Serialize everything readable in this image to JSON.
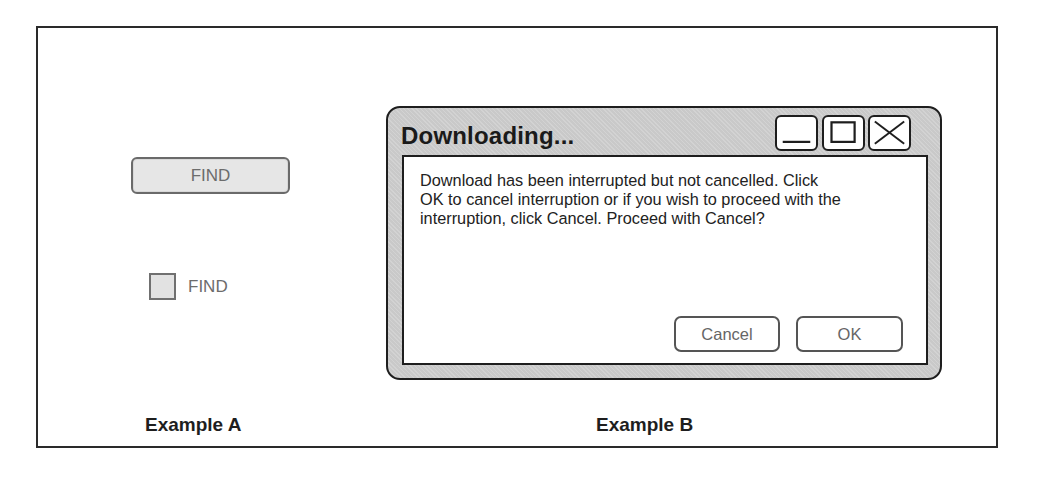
{
  "example_a": {
    "find_button_label": "FIND",
    "find_checkbox_label": "FIND",
    "caption": "Example A"
  },
  "example_b": {
    "dialog": {
      "title": "Downloading...",
      "message": "Download has been interrupted but not cancelled. Click OK to cancel interruption or if you wish to proceed with the interruption, click Cancel.  Proceed with Cancel?",
      "message_lines": [
        "Download has been interrupted but not cancelled. Click",
        "OK to cancel interruption or if you wish to proceed with the",
        "interruption, click Cancel.  Proceed with Cancel?"
      ],
      "title_buttons": [
        "minimize-icon",
        "maximize-icon",
        "close-icon"
      ],
      "buttons": {
        "cancel": "Cancel",
        "ok": "OK"
      }
    },
    "caption": "Example B"
  }
}
